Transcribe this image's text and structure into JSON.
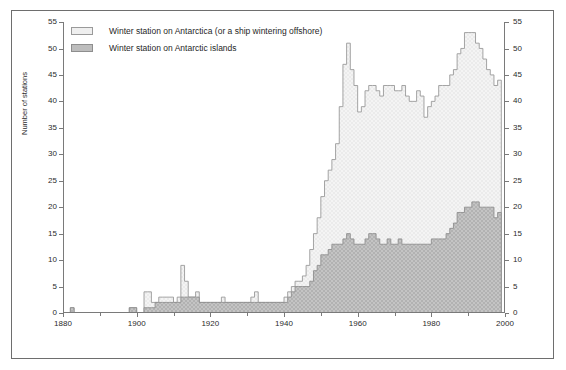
{
  "figure": {
    "y_axis_title": "Number of stations",
    "frame_color": "#6e6e6e",
    "axis_color": "#7a7a7a"
  },
  "legend": {
    "items": [
      {
        "label": "Winter station on Antarctica (or a ship wintering offshore)",
        "color": "#efefef",
        "border": "#9a9a9a"
      },
      {
        "label": "Winter station on Antarctic islands",
        "color": "#bdbdbd",
        "border": "#8e8e8e"
      }
    ]
  },
  "chart_data": {
    "type": "area",
    "title": "",
    "subtitle": "",
    "xlabel": "",
    "ylabel": "Number of stations",
    "xlim": [
      1880,
      2000
    ],
    "ylim": [
      0,
      55
    ],
    "x_major_ticks": [
      1880,
      1900,
      1920,
      1940,
      1960,
      1980,
      2000
    ],
    "x_minor_ticks": [
      1890,
      1910,
      1930,
      1950,
      1970,
      1990
    ],
    "y_ticks": [
      0,
      5,
      10,
      15,
      20,
      25,
      30,
      35,
      40,
      45,
      50,
      55
    ],
    "y_ticks_right": [
      0,
      5,
      10,
      15,
      20,
      25,
      30,
      35,
      40,
      45,
      50,
      55
    ],
    "grid": false,
    "legend_position": "top-left",
    "stacked": true,
    "x": [
      1880,
      1881,
      1882,
      1883,
      1884,
      1885,
      1886,
      1887,
      1888,
      1889,
      1890,
      1891,
      1892,
      1893,
      1894,
      1895,
      1896,
      1897,
      1898,
      1899,
      1900,
      1901,
      1902,
      1903,
      1904,
      1905,
      1906,
      1907,
      1908,
      1909,
      1910,
      1911,
      1912,
      1913,
      1914,
      1915,
      1916,
      1917,
      1918,
      1919,
      1920,
      1921,
      1922,
      1923,
      1924,
      1925,
      1926,
      1927,
      1928,
      1929,
      1930,
      1931,
      1932,
      1933,
      1934,
      1935,
      1936,
      1937,
      1938,
      1939,
      1940,
      1941,
      1942,
      1943,
      1944,
      1945,
      1946,
      1947,
      1948,
      1949,
      1950,
      1951,
      1952,
      1953,
      1954,
      1955,
      1956,
      1957,
      1958,
      1959,
      1960,
      1961,
      1962,
      1963,
      1964,
      1965,
      1966,
      1967,
      1968,
      1969,
      1970,
      1971,
      1972,
      1973,
      1974,
      1975,
      1976,
      1977,
      1978,
      1979,
      1980,
      1981,
      1982,
      1983,
      1984,
      1985,
      1986,
      1987,
      1988,
      1989,
      1990,
      1991,
      1992,
      1993,
      1994,
      1995,
      1996,
      1997,
      1998
    ],
    "series": [
      {
        "name": "Winter station on Antarctic islands",
        "color": "#bdbdbd",
        "border": "#8e8e8e",
        "values": [
          0,
          0,
          1,
          0,
          0,
          0,
          0,
          0,
          0,
          0,
          0,
          0,
          0,
          0,
          0,
          0,
          0,
          0,
          1,
          1,
          0,
          0,
          1,
          1,
          1,
          2,
          2,
          2,
          2,
          2,
          2,
          2,
          3,
          3,
          3,
          3,
          3,
          2,
          2,
          2,
          2,
          2,
          2,
          2,
          2,
          2,
          2,
          2,
          2,
          2,
          2,
          2,
          2,
          2,
          2,
          2,
          2,
          2,
          2,
          2,
          2,
          3,
          4,
          5,
          5,
          5,
          5,
          6,
          8,
          9,
          11,
          11,
          12,
          13,
          13,
          13,
          14,
          15,
          14,
          13,
          13,
          13,
          14,
          15,
          15,
          14,
          13,
          13,
          14,
          13,
          13,
          14,
          13,
          13,
          13,
          13,
          13,
          13,
          13,
          13,
          14,
          14,
          14,
          14,
          15,
          16,
          17,
          19,
          19,
          20,
          20,
          21,
          21,
          20,
          20,
          20,
          20,
          18,
          19
        ]
      },
      {
        "name": "Winter station on Antarctica (or a ship wintering offshore)",
        "color": "#efefef",
        "border": "#9a9a9a",
        "values": [
          0,
          0,
          0,
          0,
          0,
          0,
          0,
          0,
          0,
          0,
          0,
          0,
          0,
          0,
          0,
          0,
          0,
          0,
          0,
          0,
          0,
          0,
          3,
          3,
          1,
          0,
          1,
          1,
          1,
          1,
          0,
          1,
          6,
          3,
          0,
          0,
          1,
          0,
          0,
          0,
          0,
          0,
          0,
          1,
          0,
          0,
          0,
          0,
          0,
          0,
          0,
          1,
          2,
          0,
          0,
          0,
          0,
          0,
          0,
          0,
          1,
          1,
          1,
          1,
          1,
          2,
          4,
          6,
          7,
          9,
          11,
          14,
          15,
          16,
          19,
          26,
          33,
          36,
          32,
          30,
          25,
          26,
          28,
          28,
          28,
          28,
          28,
          30,
          29,
          30,
          29,
          28,
          30,
          28,
          27,
          27,
          29,
          28,
          24,
          26,
          26,
          27,
          29,
          29,
          28,
          29,
          29,
          30,
          31,
          33,
          33,
          32,
          30,
          30,
          28,
          26,
          25,
          25,
          25
        ]
      }
    ],
    "notes": {
      "peak_1990_total": 53,
      "peak_1957_total": 51,
      "final_year_total": 44,
      "final_year_islands": 19
    }
  }
}
